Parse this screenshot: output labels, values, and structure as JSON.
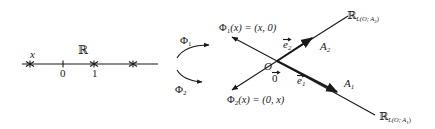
{
  "number_line": {
    "set_label": "ℝ",
    "point_label": "x",
    "tick_zero": "0",
    "tick_one": "1"
  },
  "maps": {
    "phi1_label": "Φ",
    "phi1_sub": "1",
    "phi2_label": "Φ",
    "phi2_sub": "2"
  },
  "plane": {
    "phi1_formula_head": "Φ",
    "phi1_formula_sub": "1",
    "phi1_formula_rest": "(x) = (x, 0)",
    "phi2_formula_head": "Φ",
    "phi2_formula_sub": "2",
    "phi2_formula_rest": "(x) = (0, x)",
    "origin_label": "O",
    "zero_vector": "0",
    "e1": "e",
    "e1_sub": "1",
    "e2": "e",
    "e2_sub": "2",
    "A1": "A",
    "A1_sub": "1",
    "A2": "A",
    "A2_sub": "2",
    "line1_label": "ℝ",
    "line1_sub": "L(O; A",
    "line1_subsub": "1",
    "line1_close": ")",
    "line2_label": "ℝ",
    "line2_sub": "L(O; A",
    "line2_subsub": "2",
    "line2_close": ")"
  },
  "colors": {
    "ink": "#1a1a1a",
    "background": "#ffffff"
  }
}
